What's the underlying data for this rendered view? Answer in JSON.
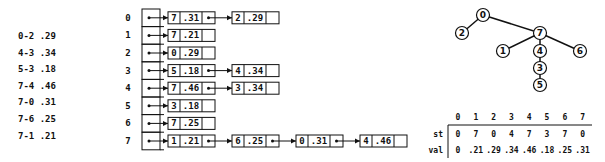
{
  "edge_list": {
    "items": [
      {
        "edge": "0-2",
        "weight": ".29"
      },
      {
        "edge": "4-3",
        "weight": ".34"
      },
      {
        "edge": "5-3",
        "weight": ".18"
      },
      {
        "edge": "7-4",
        "weight": ".46"
      },
      {
        "edge": "7-0",
        "weight": ".31"
      },
      {
        "edge": "7-6",
        "weight": ".25"
      },
      {
        "edge": "7-1",
        "weight": ".21"
      }
    ]
  },
  "adjacency_lists": {
    "rows": [
      {
        "index": "0",
        "nodes": [
          {
            "v": "7",
            "w": ".31"
          },
          {
            "v": "2",
            "w": ".29"
          }
        ]
      },
      {
        "index": "1",
        "nodes": [
          {
            "v": "7",
            "w": ".21"
          }
        ]
      },
      {
        "index": "2",
        "nodes": [
          {
            "v": "0",
            "w": ".29"
          }
        ]
      },
      {
        "index": "3",
        "nodes": [
          {
            "v": "5",
            "w": ".18"
          },
          {
            "v": "4",
            "w": ".34"
          }
        ]
      },
      {
        "index": "4",
        "nodes": [
          {
            "v": "7",
            "w": ".46"
          },
          {
            "v": "3",
            "w": ".34"
          }
        ]
      },
      {
        "index": "5",
        "nodes": [
          {
            "v": "3",
            "w": ".18"
          }
        ]
      },
      {
        "index": "6",
        "nodes": [
          {
            "v": "7",
            "w": ".25"
          }
        ]
      },
      {
        "index": "7",
        "nodes": [
          {
            "v": "1",
            "w": ".21"
          },
          {
            "v": "6",
            "w": ".25"
          },
          {
            "v": "0",
            "w": ".31"
          },
          {
            "v": "4",
            "w": ".46"
          }
        ]
      }
    ]
  },
  "tree": {
    "nodes": [
      {
        "id": "0",
        "x": 483,
        "y": 15
      },
      {
        "id": "2",
        "x": 462,
        "y": 33
      },
      {
        "id": "7",
        "x": 540,
        "y": 33
      },
      {
        "id": "1",
        "x": 503,
        "y": 51
      },
      {
        "id": "4",
        "x": 540,
        "y": 51
      },
      {
        "id": "6",
        "x": 580,
        "y": 51
      },
      {
        "id": "3",
        "x": 540,
        "y": 68
      },
      {
        "id": "5",
        "x": 540,
        "y": 85
      }
    ],
    "edges": [
      [
        "0",
        "2"
      ],
      [
        "0",
        "7"
      ],
      [
        "7",
        "1"
      ],
      [
        "7",
        "4"
      ],
      [
        "7",
        "6"
      ],
      [
        "4",
        "3"
      ],
      [
        "3",
        "5"
      ]
    ]
  },
  "mst_table": {
    "columns": [
      "0",
      "1",
      "2",
      "3",
      "4",
      "5",
      "6",
      "7"
    ],
    "rows": [
      {
        "label": "st",
        "values": [
          "0",
          "7",
          "0",
          "4",
          "7",
          "3",
          "7",
          "0"
        ]
      },
      {
        "label": "val",
        "values": [
          "0",
          ".21",
          ".29",
          ".34",
          ".46",
          ".18",
          ".25",
          ".31"
        ]
      }
    ]
  }
}
